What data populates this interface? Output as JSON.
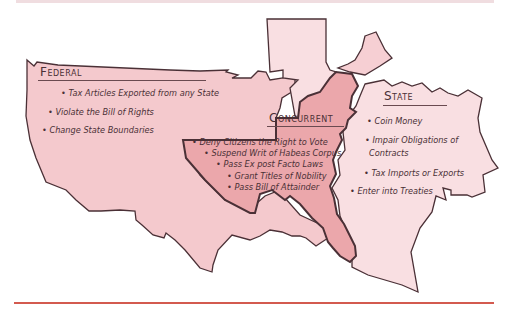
{
  "colors": {
    "federal_fill": "#f4c9cd",
    "state_fill": "#f9dfe2",
    "concurrent_fill": "#eba7ab",
    "outline": "#4a3036",
    "bottom_rule": "#d35a4f",
    "top_rule": "#f0dde0"
  },
  "federal": {
    "heading": "Federal",
    "items": [
      "Tax Articles Exported from any State",
      "Violate the Bill of Rights",
      "Change State Boundaries"
    ]
  },
  "concurrent": {
    "heading": "Concurrent",
    "items": [
      "Deny Citizens the Right to Vote",
      "Suspend Writ of Habeas Corpus",
      "Pass Ex post Facto Laws",
      "Grant Titles of Nobility",
      "Pass Bill of Attainder"
    ]
  },
  "state": {
    "heading": "State",
    "items": [
      "Coin Money",
      "Impair Obligations of",
      "Contracts",
      "Tax Imports or Exports",
      "Enter into Treaties"
    ]
  }
}
